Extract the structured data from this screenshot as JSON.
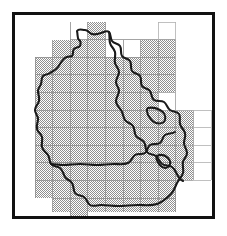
{
  "figure": {
    "kind": "map",
    "title_visible": false,
    "labels_visible": false,
    "frame": {
      "stroke_color": "#111111",
      "stroke_width_px": 3,
      "background_color": "#ffffff",
      "x": 12,
      "y": 12,
      "width": 203,
      "height": 207
    }
  },
  "map_data": {
    "type": "grid-coverage-map",
    "description": "Outline of a region with an internal sub-region boundary, overlaid by a regular rectangular grid. Most grid cells covering the region are shaded with a 50% dither/halftone pattern; a few cells are left unshaded (white).",
    "grid": {
      "cell_width_px": 17.6,
      "cell_height_px": 17.6,
      "origin_x_px": 20,
      "origin_y_px": 7,
      "columns": 9,
      "rows": 11,
      "line_color": "#8d8d8d",
      "line_width_px": 0.8,
      "shaded_fill_color": "#a8a8a8",
      "shaded_pattern": "50-percent-dither",
      "unshaded_fill_color": "#ffffff",
      "column_count_label": "9",
      "row_count_label": "11"
    },
    "cells_shaded": [
      [
        3,
        0
      ],
      [
        1,
        1
      ],
      [
        2,
        1
      ],
      [
        3,
        1
      ],
      [
        6,
        1
      ],
      [
        7,
        1
      ],
      [
        0,
        2
      ],
      [
        1,
        2
      ],
      [
        2,
        2
      ],
      [
        3,
        2
      ],
      [
        4,
        2
      ],
      [
        5,
        2
      ],
      [
        6,
        2
      ],
      [
        7,
        2
      ],
      [
        0,
        3
      ],
      [
        1,
        3
      ],
      [
        2,
        3
      ],
      [
        3,
        3
      ],
      [
        4,
        3
      ],
      [
        5,
        3
      ],
      [
        6,
        3
      ],
      [
        7,
        3
      ],
      [
        0,
        4
      ],
      [
        1,
        4
      ],
      [
        2,
        4
      ],
      [
        3,
        4
      ],
      [
        4,
        4
      ],
      [
        5,
        4
      ],
      [
        6,
        4
      ],
      [
        7,
        4
      ],
      [
        0,
        5
      ],
      [
        1,
        5
      ],
      [
        2,
        5
      ],
      [
        3,
        5
      ],
      [
        4,
        5
      ],
      [
        5,
        5
      ],
      [
        6,
        5
      ],
      [
        7,
        5
      ],
      [
        8,
        5
      ],
      [
        0,
        6
      ],
      [
        1,
        6
      ],
      [
        2,
        6
      ],
      [
        3,
        6
      ],
      [
        4,
        6
      ],
      [
        5,
        6
      ],
      [
        6,
        6
      ],
      [
        7,
        6
      ],
      [
        8,
        6
      ],
      [
        0,
        7
      ],
      [
        1,
        7
      ],
      [
        2,
        7
      ],
      [
        3,
        7
      ],
      [
        4,
        7
      ],
      [
        5,
        7
      ],
      [
        6,
        7
      ],
      [
        7,
        7
      ],
      [
        8,
        7
      ],
      [
        0,
        8
      ],
      [
        1,
        8
      ],
      [
        2,
        8
      ],
      [
        3,
        8
      ],
      [
        4,
        8
      ],
      [
        5,
        8
      ],
      [
        6,
        8
      ],
      [
        7,
        8
      ],
      [
        8,
        8
      ],
      [
        0,
        9
      ],
      [
        1,
        9
      ],
      [
        2,
        9
      ],
      [
        3,
        9
      ],
      [
        4,
        9
      ],
      [
        5,
        9
      ],
      [
        6,
        9
      ],
      [
        7,
        9
      ],
      [
        1,
        10
      ],
      [
        2,
        10
      ],
      [
        3,
        10
      ],
      [
        4,
        10
      ],
      [
        5,
        10
      ],
      [
        6,
        10
      ],
      [
        7,
        10
      ],
      [
        2,
        11
      ]
    ],
    "cells_unshaded_inside_extent": [
      [
        7,
        4
      ]
    ],
    "counts": {
      "shaded_cells": "84",
      "unshaded_gap_cells": "1"
    },
    "region_outline": {
      "stroke_color": "#1a1a1a",
      "stroke_width_px": 2.1,
      "fill": "none",
      "name": "region-boundary"
    },
    "internal_boundary": {
      "stroke_color": "#1a1a1a",
      "stroke_width_px": 2.1,
      "fill": "none",
      "name": "internal-subregion-boundary"
    },
    "extent_grid_lines": {
      "note": "Thin grid lines also continue across unshaded (white) areas to the right and top of the shaded block.",
      "color": "#a9a9a9"
    }
  },
  "colors": {
    "frame": "#111111",
    "outline": "#1a1a1a",
    "grid_line": "#8d8d8d",
    "shade": "#a8a8a8",
    "background": "#ffffff"
  },
  "icons": {
    "grid": "grid-icon",
    "map": "map-icon"
  }
}
